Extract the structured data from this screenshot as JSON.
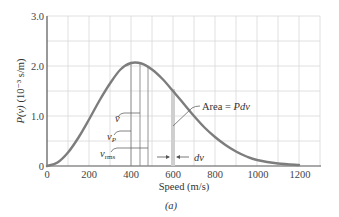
{
  "chart_data": {
    "type": "line",
    "title": "",
    "caption": "(a)",
    "xlabel": "Speed (m/s)",
    "ylabel": "P(v) (10⁻³ s/m)",
    "xlim": [
      0,
      1300
    ],
    "ylim": [
      0,
      3.0
    ],
    "grid": true,
    "x_ticks": [
      "0",
      "200",
      "400",
      "600",
      "800",
      "1000",
      "1200"
    ],
    "y_ticks": [
      "0",
      "1.0",
      "2.0",
      "3.0"
    ],
    "series": [
      {
        "name": "Maxwell speed distribution",
        "color": "#7d7d7d",
        "x": [
          0,
          50,
          100,
          150,
          200,
          250,
          300,
          350,
          400,
          450,
          500,
          550,
          600,
          650,
          700,
          750,
          800,
          850,
          900,
          950,
          1000,
          1100,
          1200
        ],
        "y": [
          0,
          0.07,
          0.27,
          0.57,
          0.93,
          1.31,
          1.65,
          1.93,
          2.06,
          2.05,
          1.93,
          1.74,
          1.5,
          1.25,
          1.0,
          0.77,
          0.58,
          0.42,
          0.29,
          0.19,
          0.12,
          0.05,
          0.02
        ]
      }
    ],
    "annotations": [
      {
        "text": "v̄",
        "x": 445,
        "desc": "average speed line"
      },
      {
        "text": "v_p",
        "x": 400,
        "desc": "most probable speed line"
      },
      {
        "text": "v_rms",
        "x": 485,
        "desc": "rms speed line"
      },
      {
        "text": "Area = Pdv",
        "x": 600,
        "desc": "shaded strip of width dv"
      },
      {
        "text": "dv",
        "x": 600,
        "desc": "strip width arrows"
      }
    ]
  },
  "labels": {
    "xlabel": "Speed (m/s)",
    "ylabel_main": "P(v)",
    "ylabel_units": "(10⁻³ s/m)",
    "caption": "(a)",
    "vbar": "v̄",
    "vp": "v",
    "vp_sub": "P",
    "vrms": "v",
    "vrms_sub": "rms",
    "area": "Area = ",
    "area_ital": "Pdv",
    "dv": "dv"
  },
  "ticks": {
    "x": [
      "0",
      "200",
      "400",
      "600",
      "800",
      "1000",
      "1200"
    ],
    "y": [
      "0",
      "1.0",
      "2.0",
      "3.0"
    ]
  }
}
